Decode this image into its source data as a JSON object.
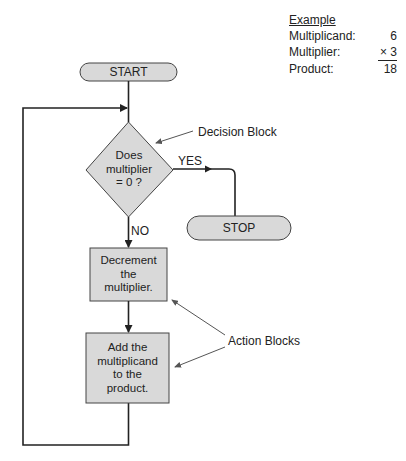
{
  "example": {
    "title": "Example",
    "rows": [
      {
        "label": "Multiplicand:",
        "value": "6"
      },
      {
        "label": "Multiplier:",
        "value": "× 3"
      },
      {
        "label": "Product:",
        "value": "18"
      }
    ]
  },
  "flowchart": {
    "start": "START",
    "decision": {
      "line1": "Does",
      "line2": "multiplier",
      "line3": "= 0 ?"
    },
    "yes": "YES",
    "no": "NO",
    "stop": "STOP",
    "action1": {
      "line1": "Decrement",
      "line2": "the",
      "line3": "multiplier."
    },
    "action2": {
      "line1": "Add the",
      "line2": "multiplicand",
      "line3": "to the",
      "line4": "product."
    }
  },
  "annotations": {
    "decision_block": "Decision Block",
    "action_blocks": "Action Blocks"
  },
  "colors": {
    "block_fill": "#d9d9d9",
    "line": "#222222",
    "annotation_line": "#555555"
  }
}
